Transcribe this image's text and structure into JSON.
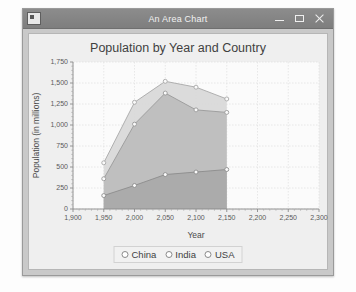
{
  "window": {
    "title": "An Area Chart",
    "icon": "app-icon",
    "controls": {
      "minimize": "minimize-icon",
      "maximize": "maximize-icon",
      "close": "close-icon"
    }
  },
  "chart_data": {
    "type": "area",
    "title": "Population by Year and Country",
    "xlabel": "Year",
    "ylabel": "Population (in millions)",
    "x": [
      1950,
      2000,
      2050,
      2100,
      2150
    ],
    "xlim": [
      1900,
      2300
    ],
    "ylim": [
      0,
      1750
    ],
    "xticks": [
      "1,900",
      "1,950",
      "2,000",
      "2,050",
      "2,100",
      "2,150",
      "2,200",
      "2,250",
      "2,300"
    ],
    "xtick_values": [
      1900,
      1950,
      2000,
      2050,
      2100,
      2150,
      2200,
      2250,
      2300
    ],
    "yticks": [
      "0",
      "250",
      "500",
      "750",
      "1,000",
      "1,250",
      "1,500",
      "1,750"
    ],
    "ytick_values": [
      0,
      250,
      500,
      750,
      1000,
      1250,
      1500,
      1750
    ],
    "grid": true,
    "stacked": false,
    "legend_position": "bottom",
    "series": [
      {
        "name": "China",
        "values": [
          550,
          1270,
          1520,
          1450,
          1310
        ],
        "color": "#d8d8d8",
        "line": "#a8a8a8"
      },
      {
        "name": "India",
        "values": [
          360,
          1010,
          1380,
          1180,
          1150
        ],
        "color": "#bdbdbd",
        "line": "#9a9a9a"
      },
      {
        "name": "USA",
        "values": [
          160,
          280,
          410,
          440,
          470
        ],
        "color": "#a9a9a9",
        "line": "#8c8c8c"
      }
    ]
  },
  "legend": {
    "items": [
      {
        "label": "China",
        "marker": "circle-marker"
      },
      {
        "label": "India",
        "marker": "circle-marker"
      },
      {
        "label": "USA",
        "marker": "circle-marker"
      }
    ]
  }
}
